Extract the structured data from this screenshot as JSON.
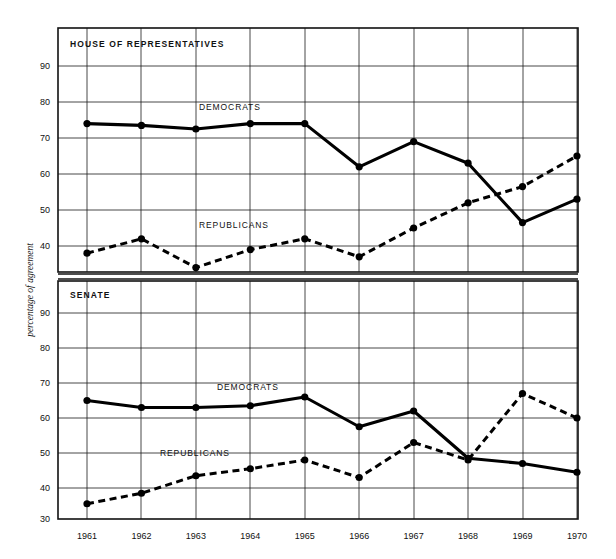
{
  "figure": {
    "ylabel": "percentage of agreement",
    "background": "#ffffff",
    "ink": "#000000"
  },
  "chart_data": [
    {
      "type": "line",
      "title": "HOUSE OF REPRESENTATIVES",
      "xlabel": "",
      "ylabel": "percentage of agreement",
      "x": [
        1961,
        1962,
        1963,
        1964,
        1965,
        1966,
        1967,
        1968,
        1969,
        1970
      ],
      "categories": [
        "1961",
        "1962",
        "1963",
        "1964",
        "1965",
        "1966",
        "1967",
        "1968",
        "1969",
        "1970"
      ],
      "ylim": [
        35,
        95
      ],
      "yticks": [
        40,
        50,
        60,
        70,
        80,
        90
      ],
      "grid": true,
      "legend": "inline-labels",
      "series": [
        {
          "name": "DEMOCRATS",
          "style": "solid",
          "values": [
            74,
            73.5,
            72.5,
            74,
            74,
            62,
            69,
            63,
            46.5,
            53
          ]
        },
        {
          "name": "REPUBLICANS",
          "style": "dashed",
          "values": [
            38,
            42,
            34,
            39,
            42,
            37,
            45,
            52,
            56.5,
            65
          ]
        }
      ]
    },
    {
      "type": "line",
      "title": "SENATE",
      "xlabel": "",
      "ylabel": "percentage of agreement",
      "x": [
        1961,
        1962,
        1963,
        1964,
        1965,
        1966,
        1967,
        1968,
        1969,
        1970
      ],
      "categories": [
        "1961",
        "1962",
        "1963",
        "1964",
        "1965",
        "1966",
        "1967",
        "1968",
        "1969",
        "1970"
      ],
      "ylim": [
        30,
        93
      ],
      "yticks": [
        30,
        40,
        50,
        60,
        70,
        80,
        90
      ],
      "grid": true,
      "legend": "inline-labels",
      "series": [
        {
          "name": "DEMOCRATS",
          "style": "solid",
          "values": [
            65,
            63,
            63,
            63.5,
            66,
            57.5,
            62,
            48.5,
            47,
            44.5
          ]
        },
        {
          "name": "REPUBLICANS",
          "style": "dashed",
          "values": [
            35.5,
            38.5,
            43.5,
            45.5,
            48,
            43,
            53,
            48,
            67,
            60
          ]
        }
      ]
    }
  ],
  "panels": {
    "house": {
      "title": "HOUSE OF REPRESENTATIVES",
      "yticks": [
        "90",
        "80",
        "70",
        "60",
        "50",
        "40"
      ],
      "democrats_label": "DEMOCRATS",
      "republicans_label": "REPUBLICANS"
    },
    "senate": {
      "title": "SENATE",
      "yticks": [
        "90",
        "80",
        "70",
        "60",
        "50",
        "40",
        "30"
      ],
      "democrats_label": "DEMOCRATS",
      "republicans_label": "REPUBLICANS"
    }
  },
  "xaxis": {
    "labels": [
      "1961",
      "1962",
      "1963",
      "1964",
      "1965",
      "1966",
      "1967",
      "1968",
      "1969",
      "1970"
    ]
  }
}
